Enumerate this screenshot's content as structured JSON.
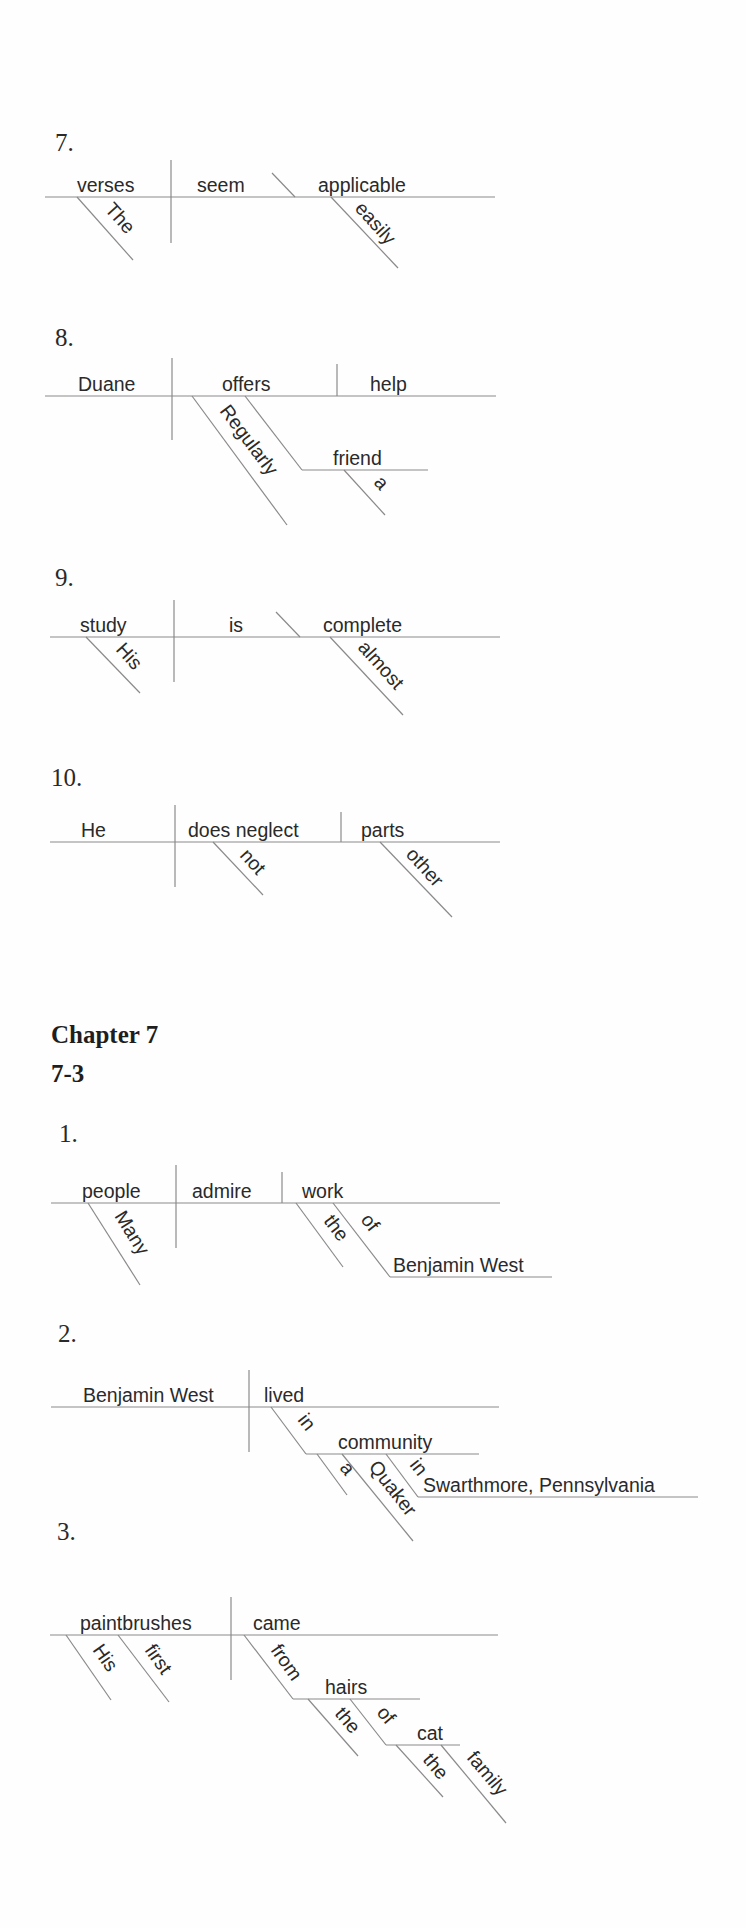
{
  "document": {
    "chapter_heading": "Chapter 7",
    "section_heading": "7-3"
  },
  "prev_items": [
    {
      "number": "7.",
      "subject": "verses",
      "subject_modifiers": [
        "The"
      ],
      "verb": "seem",
      "complement": "applicable",
      "complement_modifiers": [
        "easily"
      ]
    },
    {
      "number": "8.",
      "subject": "Duane",
      "verb": "offers",
      "verb_modifiers": [
        "Regularly"
      ],
      "direct_object": "help",
      "indirect_object": "friend",
      "indirect_object_modifiers": [
        "a"
      ]
    },
    {
      "number": "9.",
      "subject": "study",
      "subject_modifiers": [
        "His"
      ],
      "verb": "is",
      "complement": "complete",
      "complement_modifiers": [
        "almost"
      ]
    },
    {
      "number": "10.",
      "subject": "He",
      "verb": "does neglect",
      "verb_modifiers": [
        "not"
      ],
      "direct_object": "parts",
      "object_modifiers": [
        "other"
      ]
    }
  ],
  "chapter_items": [
    {
      "number": "1.",
      "subject": "people",
      "subject_modifiers": [
        "Many"
      ],
      "verb": "admire",
      "direct_object": "work",
      "object_modifiers": [
        "the"
      ],
      "preposition": "of",
      "prep_object": "Benjamin West"
    },
    {
      "number": "2.",
      "subject": "Benjamin West",
      "verb": "lived",
      "preposition": "in",
      "prep_object": "community",
      "prep_object_modifiers": [
        "a",
        "Quaker"
      ],
      "preposition2": "in",
      "prep_object2": "Swarthmore, Pennsylvania"
    },
    {
      "number": "3.",
      "subject": "paintbrushes",
      "subject_modifiers": [
        "His",
        "first"
      ],
      "verb": "came",
      "preposition": "from",
      "prep_object": "hairs",
      "prep_object_modifiers": [
        "the"
      ],
      "preposition2": "of",
      "prep_object2": "cat",
      "prep_object2_modifiers": [
        "the",
        "family"
      ]
    }
  ]
}
